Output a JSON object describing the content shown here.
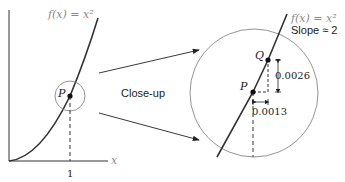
{
  "left_graph": {
    "function_label": "f(x) = x²",
    "point_label": "P",
    "x_axis_label": "x",
    "x_tick_label": "1"
  },
  "middle": {
    "closeup_label": "Close-up"
  },
  "right_graph": {
    "function_label": "f(x) = x²",
    "slope_label": "Slope ≈ 2",
    "point_p_label": "P",
    "point_q_label": "Q",
    "rise_label": "0.0026",
    "run_label": "0.0013"
  },
  "colors": {
    "curve": "#333333",
    "circle": "#888888",
    "muted_text": "#8a8a8a"
  }
}
